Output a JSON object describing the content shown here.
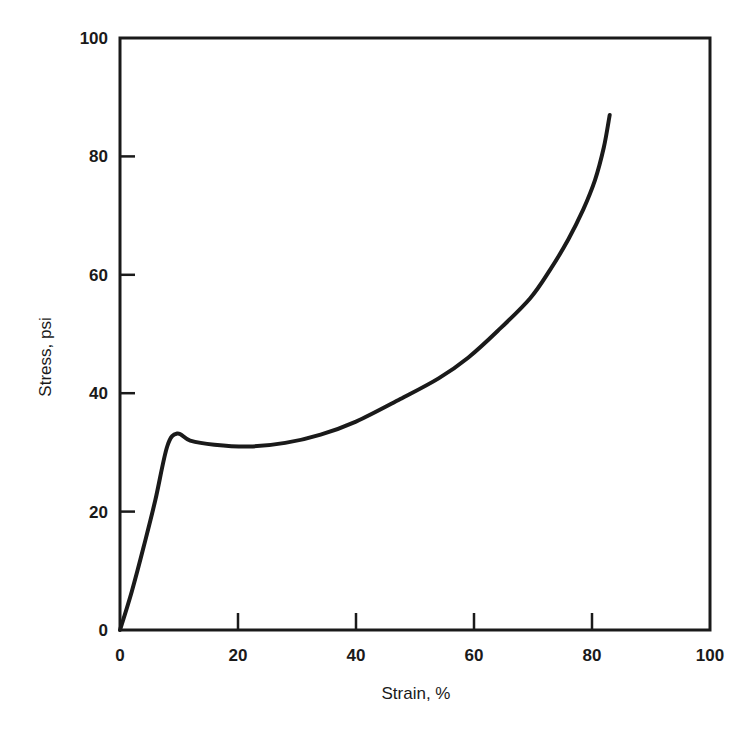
{
  "chart_data": {
    "type": "line",
    "title": "",
    "xlabel": "Strain, %",
    "ylabel": "Stress, psi",
    "xlim": [
      0,
      100
    ],
    "ylim": [
      0,
      100
    ],
    "xticks": [
      0,
      20,
      40,
      60,
      80,
      100
    ],
    "yticks": [
      0,
      20,
      40,
      60,
      80,
      100
    ],
    "grid": false,
    "legend": null,
    "series": [
      {
        "name": "stress-strain curve",
        "x": [
          0,
          2,
          4,
          6,
          8,
          9.7,
          11.9,
          16,
          22,
          28,
          34,
          40,
          47.5,
          54,
          59,
          64,
          69.5,
          73,
          76,
          78.5,
          80.5,
          82,
          83
        ],
        "y": [
          0,
          6.5,
          14,
          22,
          31,
          33.2,
          32,
          31.3,
          31,
          31.6,
          33,
          35.2,
          39,
          42.5,
          46,
          50.5,
          56,
          61,
          66,
          71,
          76,
          81.5,
          87
        ]
      }
    ]
  },
  "axes": {
    "x_title": "Strain, %",
    "y_title": "Stress, psi",
    "x_tick_labels": [
      "0",
      "20",
      "40",
      "60",
      "80",
      "100"
    ],
    "y_tick_labels": [
      "0",
      "20",
      "40",
      "60",
      "80",
      "100"
    ]
  },
  "colors": {
    "line": "#1a1a1a",
    "axis": "#1a1a1a",
    "background": "#ffffff"
  }
}
